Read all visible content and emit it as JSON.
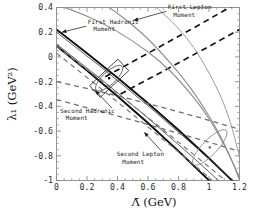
{
  "figure": {
    "background": "#ffffff",
    "frame_color": "#8a8a8a"
  },
  "chart_data": {
    "type": "line",
    "title": "",
    "xlabel": "Λ̄  (GeV)",
    "ylabel": "λ₁  (GeV²)",
    "xlim": [
      0,
      1.2
    ],
    "ylim": [
      -1,
      0.4
    ],
    "xticks": [
      0,
      0.2,
      0.4,
      0.6,
      0.8,
      1,
      1.2
    ],
    "xticklabels": [
      "0",
      "0.2",
      "0.4",
      "0.6",
      "0.8",
      "1",
      "1.2"
    ],
    "yticks": [
      0.4,
      0.2,
      0,
      -0.2,
      -0.4,
      -0.6,
      -0.8,
      -1
    ],
    "yticklabels": [
      "0.4",
      "0.2",
      "0",
      "-0.2",
      "-0.4",
      "-0.6",
      "-0.8",
      "-1"
    ],
    "grid": false,
    "legend": "none",
    "minor_ticks": true,
    "annotations": [
      {
        "id": "first-lepton-moment",
        "text_line1": "First Lepton",
        "text_line2": "Moment",
        "text_x": 0.73,
        "text_y": 0.385,
        "arrow_to_x": 0.505,
        "arrow_to_y": 0.295
      },
      {
        "id": "first-hadronic-moment",
        "text_line1": "First Hadronic",
        "text_line2": "Moment",
        "text_x": 0.205,
        "text_y": 0.265,
        "arrow_to_x": 0.035,
        "arrow_to_y": 0.2
      },
      {
        "id": "second-hadronic-moment",
        "text_line1": "Second Hadronic",
        "text_line2": "Moment",
        "text_x": 0.025,
        "text_y": -0.455,
        "arrow_to_x": 0.255,
        "arrow_to_y": -0.272
      },
      {
        "id": "second-lepton-moment",
        "text_line1": "Second Lepton",
        "text_line2": "Moment",
        "text_x": 0.395,
        "text_y": -0.805,
        "arrow_to_x": 0.575,
        "arrow_to_y": -0.61
      }
    ],
    "series": [
      {
        "name": "first-hadronic-band-upper",
        "style": "solid",
        "color": "#101010",
        "width": 1.9,
        "points": [
          [
            0,
            0.222
          ],
          [
            0.2,
            0.03
          ],
          [
            0.4,
            -0.168
          ],
          [
            0.6,
            -0.375
          ],
          [
            0.8,
            -0.592
          ],
          [
            1.0,
            -0.82
          ],
          [
            1.13,
            -0.975
          ],
          [
            1.2,
            -1.06
          ]
        ]
      },
      {
        "name": "first-hadronic-band-lower",
        "style": "solid",
        "color": "#101010",
        "width": 1.9,
        "points": [
          [
            0,
            0.088
          ],
          [
            0.2,
            -0.11
          ],
          [
            0.4,
            -0.318
          ],
          [
            0.6,
            -0.535
          ],
          [
            0.8,
            -0.762
          ],
          [
            0.95,
            -0.94
          ],
          [
            1.03,
            -1.035
          ]
        ]
      },
      {
        "name": "first-hadronic-inner-a",
        "style": "solid",
        "color": "#3a3a3a",
        "width": 0.8,
        "points": [
          [
            0,
            0.2
          ],
          [
            0.3,
            -0.09
          ],
          [
            0.6,
            -0.395
          ],
          [
            0.9,
            -0.715
          ],
          [
            1.1,
            -0.935
          ],
          [
            1.2,
            -1.05
          ]
        ]
      },
      {
        "name": "first-hadronic-inner-b",
        "style": "solid",
        "color": "#3a3a3a",
        "width": 0.8,
        "points": [
          [
            0,
            0.105
          ],
          [
            0.3,
            -0.188
          ],
          [
            0.6,
            -0.495
          ],
          [
            0.9,
            -0.818
          ],
          [
            1.08,
            -1.02
          ]
        ]
      },
      {
        "name": "first-lepton-dashed-upper",
        "style": "dashed",
        "color": "#141414",
        "width": 1.7,
        "points": [
          [
            0.32,
            -0.16
          ],
          [
            0.6,
            0.03
          ],
          [
            0.9,
            0.235
          ],
          [
            1.2,
            0.445
          ]
        ]
      },
      {
        "name": "first-lepton-dashed-lower",
        "style": "dashed",
        "color": "#141414",
        "width": 1.7,
        "points": [
          [
            0.42,
            -0.3
          ],
          [
            0.7,
            -0.115
          ],
          [
            1.0,
            0.085
          ],
          [
            1.2,
            0.222
          ]
        ]
      },
      {
        "name": "second-hadronic-dashed-upper",
        "style": "dashed",
        "color": "#6f6f6f",
        "width": 1.3,
        "points": [
          [
            0,
            -0.2
          ],
          [
            0.2,
            -0.255
          ],
          [
            0.45,
            -0.33
          ],
          [
            0.7,
            -0.41
          ],
          [
            0.95,
            -0.495
          ],
          [
            1.2,
            -0.585
          ]
        ]
      },
      {
        "name": "second-hadronic-dashed-lower",
        "style": "dashed",
        "color": "#6f6f6f",
        "width": 1.3,
        "points": [
          [
            0,
            -0.345
          ],
          [
            0.25,
            -0.428
          ],
          [
            0.5,
            -0.512
          ],
          [
            0.75,
            -0.6
          ],
          [
            1.0,
            -0.69
          ],
          [
            1.2,
            -0.765
          ]
        ]
      },
      {
        "name": "second-lepton-dashed-a",
        "style": "dashed",
        "color": "#7a7a7a",
        "width": 1.2,
        "points": [
          [
            0,
            0.085
          ],
          [
            0.25,
            -0.15
          ],
          [
            0.5,
            -0.392
          ],
          [
            0.75,
            -0.64
          ],
          [
            1.0,
            -0.89
          ],
          [
            1.1,
            -0.992
          ]
        ]
      },
      {
        "name": "second-lepton-dashed-b",
        "style": "dashed",
        "color": "#7a7a7a",
        "width": 1.2,
        "points": [
          [
            0,
            0.03
          ],
          [
            0.25,
            -0.215
          ],
          [
            0.5,
            -0.465
          ],
          [
            0.75,
            -0.718
          ],
          [
            0.98,
            -0.955
          ],
          [
            1.02,
            -1.0
          ]
        ]
      },
      {
        "name": "lepton-curve-outer",
        "style": "solid",
        "color": "#8d8d8d",
        "width": 1.1,
        "curve": true,
        "points": [
          [
            0,
            0.425
          ],
          [
            0.2,
            0.33
          ],
          [
            0.4,
            0.205
          ],
          [
            0.6,
            0.04
          ],
          [
            0.75,
            -0.12
          ],
          [
            0.9,
            -0.33
          ],
          [
            1.0,
            -0.5
          ],
          [
            1.1,
            -0.715
          ],
          [
            1.18,
            -0.92
          ],
          [
            1.2,
            -0.985
          ]
        ]
      },
      {
        "name": "lepton-curve-inner",
        "style": "solid",
        "color": "#8d8d8d",
        "width": 1.1,
        "curve": true,
        "points": [
          [
            0.3,
            0.44
          ],
          [
            0.45,
            0.305
          ],
          [
            0.6,
            0.145
          ],
          [
            0.75,
            -0.055
          ],
          [
            0.88,
            -0.255
          ],
          [
            1.0,
            -0.478
          ],
          [
            1.08,
            -0.655
          ],
          [
            1.15,
            -0.84
          ],
          [
            1.2,
            -0.995
          ]
        ]
      },
      {
        "name": "lepton-curve-third",
        "style": "solid",
        "color": "#9a9a9a",
        "width": 1.0,
        "curve": true,
        "points": [
          [
            0.62,
            0.44
          ],
          [
            0.78,
            0.255
          ],
          [
            0.9,
            0.075
          ],
          [
            1.0,
            -0.13
          ],
          [
            1.08,
            -0.33
          ],
          [
            1.14,
            -0.53
          ],
          [
            1.19,
            -0.76
          ],
          [
            1.2,
            -0.82
          ]
        ]
      }
    ],
    "contours": [
      {
        "name": "fit-ellipse-left",
        "cx": 0.345,
        "cy": -0.172,
        "rx": 0.115,
        "ry": 0.052,
        "angle": -43,
        "color": "#5a5a5a"
      },
      {
        "name": "fit-box-left",
        "cx": 0.345,
        "cy": -0.172,
        "w": 0.255,
        "h": 0.128,
        "angle": -43,
        "color": "#2a2a2a"
      },
      {
        "name": "fit-ellipse-right",
        "cx": 1.005,
        "cy": -0.732,
        "rx": 0.155,
        "ry": 0.06,
        "angle": -46,
        "color": "#8a8a8a"
      }
    ],
    "markers": [
      {
        "name": "best-fit-point-left",
        "x": 0.345,
        "y": -0.172,
        "size": 2.3,
        "color": "#101010"
      },
      {
        "name": "best-fit-point-right",
        "x": 1.005,
        "y": -0.732,
        "size": 2.1,
        "color": "#555555"
      }
    ]
  }
}
